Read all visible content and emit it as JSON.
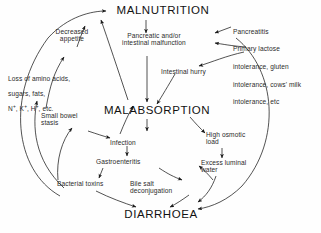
{
  "figure": {
    "type": "flow-diagram",
    "background_color": "#fefefe",
    "line_color": "#1a1a1a"
  },
  "nodes": {
    "malnutrition": "MALNUTRITION",
    "malabsorption": "MALABSORPTION",
    "diarrhoea": "DIARRHOEA",
    "decreased_appetite": "Decreased\nappetite",
    "pancreatic_malfunction": "Pancreatic and/or\nintestinal malfunction",
    "intestinal_hurry": "Intestinal hurry",
    "loss_line1": "Loss of amino acids,",
    "loss_line2": "sugars, fats,",
    "loss_line3_pre": "N",
    "loss_line3_sup1": "+",
    "loss_line3_mid1": ", K",
    "loss_line3_sup2": "+",
    "loss_line3_mid2": ", H",
    "loss_line3_sup3": "+",
    "loss_line3_end": ", etc.",
    "small_bowel_stasis": "Small bowel\nstasis",
    "infection": "Infection",
    "gastroenteritis": "Gastroenteritis",
    "bacterial_toxins": "Bacterial toxins",
    "bile_salt_deconjugation": "Bile salt\ndeconjugation",
    "high_osmotic_load": "High osmotic\nload",
    "excess_luminal_water": "Excess luminal\nwater"
  },
  "etiology_list": {
    "line1": "Pancreatitis",
    "line2": "Primary lactose",
    "line3": "intolerance, gluten",
    "line4": "intolerance, cows' milk",
    "line5": "intolerance, etc"
  }
}
